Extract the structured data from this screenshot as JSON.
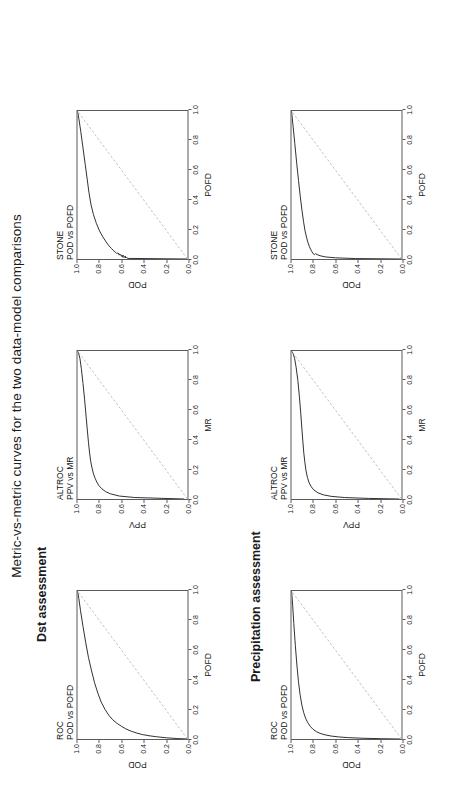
{
  "figure": {
    "title": "Metric-vs-metric curves for the two data-model comparisons",
    "sections": [
      {
        "id": "dst",
        "label": "Dst assessment"
      },
      {
        "id": "precipitation",
        "label": "Precipitation assessment"
      }
    ]
  },
  "axis_ticks": [
    "0.0",
    "0.2",
    "0.4",
    "0.6",
    "0.8",
    "1.0"
  ],
  "chart_data": [
    {
      "id": "dst-roc",
      "type": "line",
      "section": "Dst assessment",
      "title": "ROC",
      "subtitle": "POD vs POFD",
      "xlabel": "POFD",
      "ylabel": "POD",
      "xlim": [
        0,
        1
      ],
      "ylim": [
        0,
        1
      ],
      "xticks": [
        "0.0",
        "0.2",
        "0.4",
        "0.6",
        "0.8",
        "1.0"
      ],
      "yticks": [
        "0.0",
        "0.2",
        "0.4",
        "0.6",
        "0.8",
        "1.0"
      ],
      "grid": false,
      "legend": "none",
      "series": [
        {
          "name": "ROC curve",
          "color": "#1a1a1a",
          "style": "solid",
          "x": [
            0.0,
            0.003,
            0.008,
            0.015,
            0.022,
            0.03,
            0.04,
            0.052,
            0.068,
            0.086,
            0.105,
            0.13,
            0.16,
            0.2,
            0.25,
            0.31,
            0.38,
            0.46,
            0.55,
            0.65,
            0.76,
            0.87,
            0.95,
            1.0
          ],
          "y": [
            0.0,
            0.09,
            0.19,
            0.28,
            0.35,
            0.41,
            0.46,
            0.51,
            0.56,
            0.6,
            0.64,
            0.68,
            0.715,
            0.75,
            0.785,
            0.815,
            0.845,
            0.872,
            0.9,
            0.925,
            0.95,
            0.973,
            0.988,
            1.0
          ]
        },
        {
          "name": "no-skill diagonal",
          "color": "#b0b0b0",
          "style": "dashed",
          "x": [
            0,
            1
          ],
          "y": [
            0,
            1
          ]
        }
      ]
    },
    {
      "id": "dst-altroc",
      "type": "line",
      "section": "Dst assessment",
      "title": "ALTROC",
      "subtitle": "PPV vs MR",
      "xlabel": "MR",
      "ylabel": "PPV",
      "xlim": [
        0,
        1
      ],
      "ylim": [
        0,
        1
      ],
      "xticks": [
        "0.0",
        "0.2",
        "0.4",
        "0.6",
        "0.8",
        "1.0"
      ],
      "yticks": [
        "0.0",
        "0.2",
        "0.4",
        "0.6",
        "0.8",
        "1.0"
      ],
      "grid": false,
      "legend": "none",
      "series": [
        {
          "name": "ALTROC curve",
          "color": "#1a1a1a",
          "style": "solid",
          "x": [
            0.0,
            0.01,
            0.02,
            0.035,
            0.05,
            0.07,
            0.09,
            0.115,
            0.14,
            0.17,
            0.21,
            0.255,
            0.31,
            0.38,
            0.46,
            0.56,
            0.67,
            0.78,
            0.88,
            0.95,
            0.985,
            1.0
          ],
          "y": [
            0.03,
            0.48,
            0.62,
            0.7,
            0.745,
            0.78,
            0.805,
            0.825,
            0.84,
            0.855,
            0.868,
            0.88,
            0.89,
            0.9,
            0.91,
            0.922,
            0.935,
            0.95,
            0.965,
            0.978,
            0.99,
            1.0
          ]
        },
        {
          "name": "no-skill diagonal",
          "color": "#b0b0b0",
          "style": "dashed",
          "x": [
            0,
            1
          ],
          "y": [
            0,
            1
          ]
        }
      ]
    },
    {
      "id": "dst-stone",
      "type": "line",
      "section": "Dst assessment",
      "title": "STONE",
      "subtitle": "POD vs POFD",
      "xlabel": "POFD",
      "ylabel": "POD",
      "xlim": [
        0,
        1
      ],
      "ylim": [
        0,
        1
      ],
      "xticks": [
        "0.0",
        "0.2",
        "0.4",
        "0.6",
        "0.8",
        "1.0"
      ],
      "yticks": [
        "0.0",
        "0.2",
        "0.4",
        "0.6",
        "0.8",
        "1.0"
      ],
      "grid": false,
      "legend": "none",
      "series": [
        {
          "name": "STONE curve",
          "color": "#1a1a1a",
          "style": "solid",
          "x": [
            0.0,
            0.004,
            0.01,
            0.012,
            0.016,
            0.013,
            0.018,
            0.022,
            0.02,
            0.026,
            0.03,
            0.028,
            0.034,
            0.04,
            0.038,
            0.046,
            0.055,
            0.07,
            0.09,
            0.115,
            0.15,
            0.19,
            0.24,
            0.3,
            0.37,
            0.45,
            0.54,
            0.64,
            0.75,
            0.86,
            0.94,
            1.0
          ],
          "y": [
            0.0,
            0.54,
            0.555,
            0.57,
            0.56,
            0.585,
            0.595,
            0.58,
            0.605,
            0.6,
            0.615,
            0.625,
            0.62,
            0.635,
            0.645,
            0.655,
            0.67,
            0.69,
            0.715,
            0.74,
            0.77,
            0.8,
            0.828,
            0.855,
            0.878,
            0.896,
            0.912,
            0.93,
            0.95,
            0.97,
            0.986,
            1.0
          ]
        },
        {
          "name": "no-skill diagonal",
          "color": "#b0b0b0",
          "style": "dashed",
          "x": [
            0,
            1
          ],
          "y": [
            0,
            1
          ]
        }
      ]
    },
    {
      "id": "precip-roc",
      "type": "line",
      "section": "Precipitation assessment",
      "title": "ROC",
      "subtitle": "POD vs POFD",
      "xlabel": "POFD",
      "ylabel": "POD",
      "xlim": [
        0,
        1
      ],
      "ylim": [
        0,
        1
      ],
      "xticks": [
        "0.0",
        "0.2",
        "0.4",
        "0.6",
        "0.8",
        "1.0"
      ],
      "yticks": [
        "0.0",
        "0.2",
        "0.4",
        "0.6",
        "0.8",
        "1.0"
      ],
      "grid": false,
      "legend": "none",
      "series": [
        {
          "name": "ROC curve",
          "color": "#1a1a1a",
          "style": "solid",
          "x": [
            0.0,
            0.002,
            0.005,
            0.009,
            0.014,
            0.02,
            0.028,
            0.038,
            0.05,
            0.066,
            0.086,
            0.11,
            0.14,
            0.18,
            0.23,
            0.3,
            0.39,
            0.5,
            0.63,
            0.78,
            0.9,
            0.97,
            1.0
          ],
          "y": [
            0.01,
            0.18,
            0.35,
            0.48,
            0.57,
            0.64,
            0.695,
            0.74,
            0.775,
            0.805,
            0.83,
            0.852,
            0.872,
            0.89,
            0.906,
            0.922,
            0.937,
            0.951,
            0.965,
            0.979,
            0.989,
            0.996,
            1.0
          ]
        },
        {
          "name": "no-skill diagonal",
          "color": "#b0b0b0",
          "style": "dashed",
          "x": [
            0,
            1
          ],
          "y": [
            0,
            1
          ]
        }
      ]
    },
    {
      "id": "precip-altroc",
      "type": "line",
      "section": "Precipitation assessment",
      "title": "ALTROC",
      "subtitle": "PPV vs MR",
      "xlabel": "MR",
      "ylabel": "PPV",
      "xlim": [
        0,
        1
      ],
      "ylim": [
        0,
        1
      ],
      "xticks": [
        "0.0",
        "0.2",
        "0.4",
        "0.6",
        "0.8",
        "1.0"
      ],
      "yticks": [
        "0.0",
        "0.2",
        "0.4",
        "0.6",
        "0.8",
        "1.0"
      ],
      "grid": false,
      "legend": "none",
      "series": [
        {
          "name": "ALTROC curve",
          "color": "#1a1a1a",
          "style": "solid",
          "x": [
            0.0,
            0.004,
            0.01,
            0.018,
            0.028,
            0.042,
            0.06,
            0.082,
            0.11,
            0.145,
            0.19,
            0.245,
            0.31,
            0.39,
            0.48,
            0.58,
            0.69,
            0.8,
            0.89,
            0.95,
            0.985,
            1.0
          ],
          "y": [
            0.02,
            0.3,
            0.52,
            0.64,
            0.71,
            0.76,
            0.795,
            0.82,
            0.84,
            0.855,
            0.868,
            0.878,
            0.888,
            0.897,
            0.906,
            0.916,
            0.928,
            0.942,
            0.958,
            0.972,
            0.986,
            1.0
          ]
        },
        {
          "name": "no-skill diagonal",
          "color": "#b0b0b0",
          "style": "dashed",
          "x": [
            0,
            1
          ],
          "y": [
            0,
            1
          ]
        }
      ]
    },
    {
      "id": "precip-stone",
      "type": "line",
      "section": "Precipitation assessment",
      "title": "STONE",
      "subtitle": "POD vs POFD",
      "xlabel": "POFD",
      "ylabel": "POD",
      "xlim": [
        0,
        1
      ],
      "ylim": [
        0,
        1
      ],
      "xticks": [
        "0.0",
        "0.2",
        "0.4",
        "0.6",
        "0.8",
        "1.0"
      ],
      "yticks": [
        "0.0",
        "0.2",
        "0.4",
        "0.6",
        "0.8",
        "1.0"
      ],
      "grid": false,
      "legend": "none",
      "series": [
        {
          "name": "STONE curve",
          "color": "#1a1a1a",
          "style": "solid",
          "x": [
            0.0,
            0.003,
            0.008,
            0.014,
            0.022,
            0.03,
            0.036,
            0.03,
            0.034,
            0.04,
            0.05,
            0.065,
            0.085,
            0.112,
            0.148,
            0.195,
            0.255,
            0.33,
            0.42,
            0.53,
            0.65,
            0.78,
            0.9,
            1.0
          ],
          "y": [
            0.0,
            0.42,
            0.6,
            0.69,
            0.74,
            0.768,
            0.782,
            0.79,
            0.8,
            0.806,
            0.815,
            0.826,
            0.838,
            0.851,
            0.864,
            0.878,
            0.891,
            0.905,
            0.92,
            0.936,
            0.953,
            0.97,
            0.986,
            1.0
          ]
        },
        {
          "name": "no-skill diagonal",
          "color": "#b0b0b0",
          "style": "dashed",
          "x": [
            0,
            1
          ],
          "y": [
            0,
            1
          ]
        }
      ]
    }
  ]
}
